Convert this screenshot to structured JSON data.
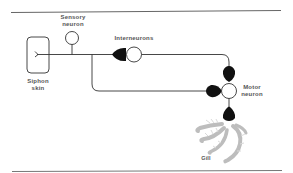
{
  "diagram": {
    "type": "neural-circuit",
    "labels": {
      "sensory_neuron_line1": "Sensory",
      "sensory_neuron_line2": "neuron",
      "siphon_skin_line1": "Siphon",
      "siphon_skin_line2": "skin",
      "interneurons": "Interneurons",
      "motor_neuron_line1": "Motor",
      "motor_neuron_line2": "neuron",
      "gill": "Gill"
    },
    "nodes": [
      {
        "id": "siphon-skin",
        "label": "Siphon skin",
        "shape": "rounded-rect"
      },
      {
        "id": "sensory-neuron",
        "label": "Sensory neuron",
        "shape": "circle"
      },
      {
        "id": "interneurons",
        "label": "Interneurons",
        "shape": "circle"
      },
      {
        "id": "motor-neuron",
        "label": "Motor neuron",
        "shape": "circle"
      },
      {
        "id": "gill",
        "label": "Gill",
        "shape": "feather"
      }
    ],
    "edges": [
      {
        "from": "siphon-skin",
        "to": "sensory-neuron"
      },
      {
        "from": "sensory-neuron",
        "to": "interneurons",
        "synapse": "excitatory"
      },
      {
        "from": "interneurons",
        "to": "motor-neuron",
        "synapse": "excitatory"
      },
      {
        "from": "sensory-neuron",
        "to": "motor-neuron",
        "synapse": "excitatory"
      },
      {
        "from": "motor-neuron",
        "to": "gill",
        "synapse": "excitatory"
      }
    ],
    "colors": {
      "line": "#333333",
      "synapse": "#111111",
      "gill": "#b8b8b8",
      "text": "#555555",
      "rule": "#666666"
    }
  }
}
